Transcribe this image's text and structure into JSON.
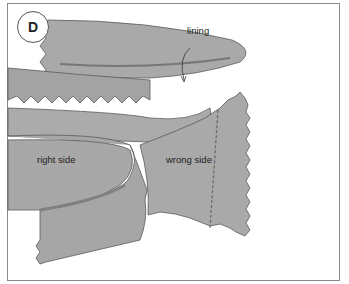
{
  "figure": {
    "step_badge": "D",
    "labels": {
      "lining": "lining",
      "right_side": "right side",
      "wrong_side": "wrong side"
    },
    "colors": {
      "fabric": "#a8a8a8",
      "fabric_dark": "#8c8c8c",
      "outline": "#5a5a5a",
      "border": "#8a8a8a"
    }
  }
}
